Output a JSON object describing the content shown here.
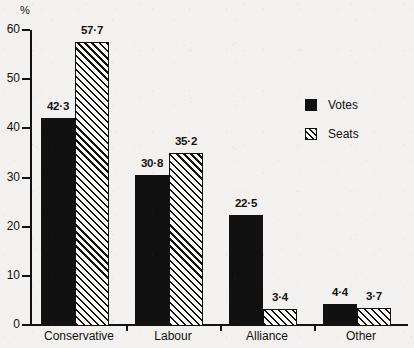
{
  "chart_data": {
    "type": "bar",
    "title": "",
    "subtitle": "",
    "xlabel": "",
    "ylabel": "%",
    "ylim": [
      0,
      60
    ],
    "yticks": [
      0,
      10,
      20,
      30,
      40,
      50,
      60
    ],
    "ytick_labels": [
      "0",
      "10",
      "20",
      "30",
      "40",
      "50",
      "60"
    ],
    "grid": false,
    "legend_position": "top-right",
    "categories": [
      "Conservative",
      "Labour",
      "Alliance",
      "Other"
    ],
    "series": [
      {
        "name": "Votes",
        "fill": "solid-black",
        "values": [
          42.3,
          30.8,
          22.5,
          4.4
        ],
        "data_labels": [
          "42·3",
          "30·8",
          "22·5",
          "4·4"
        ]
      },
      {
        "name": "Seats",
        "fill": "diagonal-hatch",
        "values": [
          57.7,
          35.2,
          3.4,
          3.7
        ],
        "data_labels": [
          "57·7",
          "35·2",
          "3·4",
          "3·7"
        ]
      }
    ]
  },
  "legend": {
    "items": [
      {
        "label": "Votes",
        "swatch": "solid-square-icon"
      },
      {
        "label": "Seats",
        "swatch": "hatched-square-icon"
      }
    ]
  },
  "colors": {
    "ink": "#111111",
    "paper": "#f3f1ef",
    "hatch_background": "#faf9f8"
  }
}
